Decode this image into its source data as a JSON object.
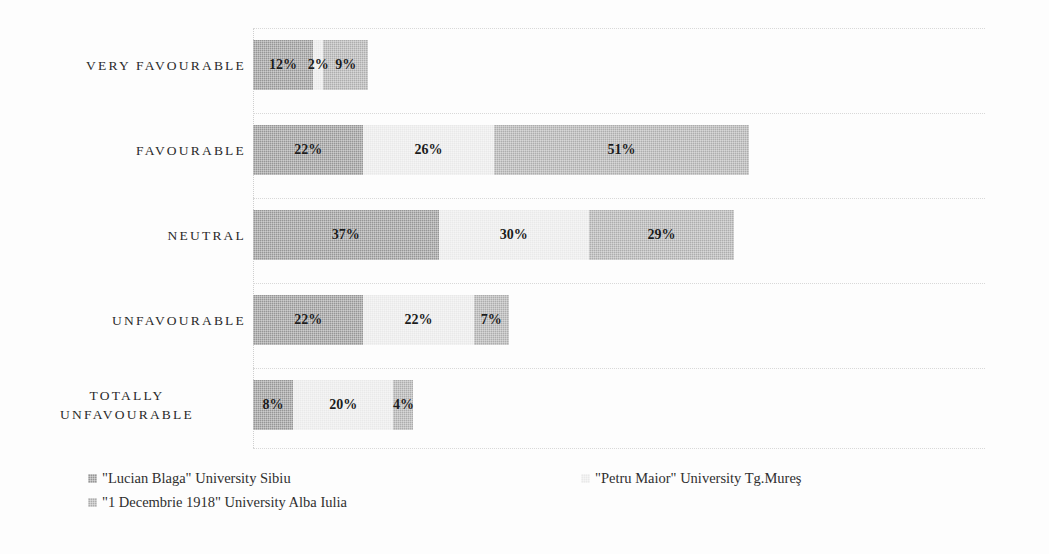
{
  "chart_data": {
    "type": "bar",
    "title": "",
    "subtitle": "",
    "xlabel": "",
    "ylabel": "",
    "orientation": "horizontal",
    "stacked": true,
    "grid": true,
    "legend_position": "bottom-left",
    "axis_max_percent": 146,
    "categories": [
      "VERY FAVOURABLE",
      "FAVOURABLE",
      "NEUTRAL",
      "UNFAVOURABLE",
      "TOTALLY UNFAVOURABLE"
    ],
    "series": [
      {
        "name": "\"Lucian Blaga\" University Sibiu",
        "color": "#969696",
        "values": [
          12,
          22,
          37,
          22,
          8
        ],
        "labels": [
          "12%",
          "22%",
          "37%",
          "22%",
          "8%"
        ]
      },
      {
        "name": "\"Petru Maior\" University Tg.Mureş",
        "color": "#e9e9e9",
        "values": [
          2,
          26,
          30,
          22,
          20
        ],
        "labels": [
          "2%",
          "26%",
          "30%",
          "22%",
          "20%"
        ]
      },
      {
        "name": "\"1 Decembrie 1918\" University Alba Iulia",
        "color": "#adadad",
        "values": [
          9,
          51,
          29,
          7,
          4
        ],
        "labels": [
          "9%",
          "51%",
          "29%",
          "7%",
          "4%"
        ]
      }
    ]
  },
  "rows": [
    {
      "label": "VERY FAVOURABLE",
      "label_lines": [
        "VERY FAVOURABLE"
      ],
      "segments": [
        {
          "label": "12%",
          "value": 12,
          "color": "#969696"
        },
        {
          "label": "2%",
          "value": 2,
          "color": "#e9e9e9"
        },
        {
          "label": "9%",
          "value": 9,
          "color": "#adadad"
        }
      ]
    },
    {
      "label": "FAVOURABLE",
      "label_lines": [
        "FAVOURABLE"
      ],
      "segments": [
        {
          "label": "22%",
          "value": 22,
          "color": "#969696"
        },
        {
          "label": "26%",
          "value": 26,
          "color": "#e9e9e9"
        },
        {
          "label": "51%",
          "value": 51,
          "color": "#adadad"
        }
      ]
    },
    {
      "label": "NEUTRAL",
      "label_lines": [
        "NEUTRAL"
      ],
      "segments": [
        {
          "label": "37%",
          "value": 37,
          "color": "#969696"
        },
        {
          "label": "30%",
          "value": 30,
          "color": "#e9e9e9"
        },
        {
          "label": "29%",
          "value": 29,
          "color": "#adadad"
        }
      ]
    },
    {
      "label": "UNFAVOURABLE",
      "label_lines": [
        "UNFAVOURABLE"
      ],
      "segments": [
        {
          "label": "22%",
          "value": 22,
          "color": "#969696"
        },
        {
          "label": "22%",
          "value": 22,
          "color": "#e9e9e9"
        },
        {
          "label": "7%",
          "value": 7,
          "color": "#adadad"
        }
      ]
    },
    {
      "label": "TOTALLY UNFAVOURABLE",
      "label_lines": [
        "TOTALLY",
        "UNFAVOURABLE"
      ],
      "segments": [
        {
          "label": "8%",
          "value": 8,
          "color": "#969696"
        },
        {
          "label": "20%",
          "value": 20,
          "color": "#e9e9e9"
        },
        {
          "label": "4%",
          "value": 4,
          "color": "#adadad"
        }
      ]
    }
  ],
  "legend": {
    "items": [
      {
        "text": "\"Lucian Blaga\" University Sibiu",
        "color": "#969696"
      },
      {
        "text": "\"Petru Maior\" University Tg.Mureş",
        "color": "#e9e9e9"
      },
      {
        "text": "\"1 Decembrie 1918\" University Alba Iulia",
        "color": "#adadad"
      }
    ]
  }
}
